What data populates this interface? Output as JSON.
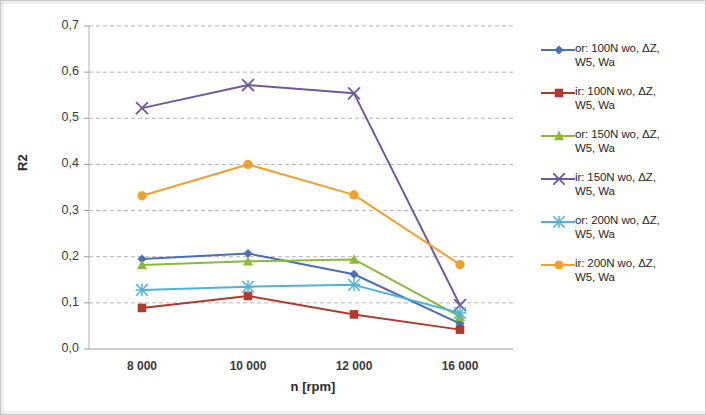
{
  "chart_data": {
    "type": "line",
    "title": "",
    "xlabel": "n [rpm]",
    "ylabel": "R2",
    "categories": [
      "8 000",
      "10 000",
      "12 000",
      "16 000"
    ],
    "ylim": [
      0.0,
      0.7
    ],
    "ytick_step": 0.1,
    "ytick_labels": [
      "0,0",
      "0,1",
      "0,2",
      "0,3",
      "0,4",
      "0,5",
      "0,6",
      "0,7"
    ],
    "grid": "horizontal-dashed",
    "legend_position": "right",
    "decimal_separator": ",",
    "series": [
      {
        "name": "or: 100N wo, ΔZ, W5, Wa",
        "label_line1": "or: 100N wo, ΔZ,",
        "label_line2": "W5, Wa",
        "color": "#4A6FB5",
        "marker": "diamond",
        "values": [
          0.195,
          0.207,
          0.162,
          0.055
        ]
      },
      {
        "name": "ir: 100N wo, ΔZ, W5, Wa",
        "label_line1": "ir: 100N wo, ΔZ,",
        "label_line2": "W5, Wa",
        "color": "#B03A2E",
        "marker": "square",
        "values": [
          0.089,
          0.115,
          0.075,
          0.042
        ]
      },
      {
        "name": "or: 150N wo, ΔZ, W5, Wa",
        "label_line1": "or: 150N wo, ΔZ,",
        "label_line2": "W5, Wa",
        "color": "#8CB83C",
        "marker": "triangle",
        "values": [
          0.182,
          0.19,
          0.194,
          0.07
        ]
      },
      {
        "name": "ir: 150N wo, ΔZ, W5, Wa",
        "label_line1": "ir: 150N wo, ΔZ,",
        "label_line2": "W5, Wa",
        "color": "#70589C",
        "marker": "cross",
        "values": [
          0.522,
          0.572,
          0.554,
          0.095
        ]
      },
      {
        "name": "or: 200N wo, ΔZ, W5, Wa",
        "label_line1": "or: 200N wo, ΔZ,",
        "label_line2": "W5, Wa",
        "color": "#4EB3DA",
        "marker": "asterisk",
        "values": [
          0.128,
          0.135,
          0.139,
          0.078
        ]
      },
      {
        "name": "ir: 200N wo, ΔZ, W5, Wa",
        "label_line1": "ir: 200N wo, ΔZ,",
        "label_line2": "W5, Wa",
        "color": "#F0A030",
        "marker": "circle",
        "values": [
          0.332,
          0.4,
          0.334,
          0.183
        ]
      }
    ]
  }
}
